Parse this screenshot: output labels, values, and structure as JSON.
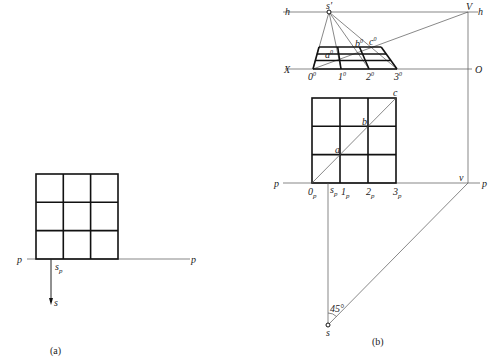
{
  "figure_a": {
    "caption": "(a)",
    "labels": {
      "p_left": "p",
      "p_right": "p",
      "s_p": "s",
      "s_p_sub": "p",
      "s": "s"
    },
    "grid": {
      "rows": 3,
      "cols": 3
    }
  },
  "figure_b": {
    "caption": "(b)",
    "labels": {
      "h_left": "h",
      "h_right": "h",
      "s_prime": "s′",
      "V": "V",
      "X": "X",
      "O": "O",
      "p_left": "p",
      "p_right": "p",
      "v": "v",
      "a": "a",
      "b": "b",
      "c": "c",
      "a0": "a",
      "b0": "b",
      "c0": "c",
      "sup0": "0",
      "pts_picture": [
        "0",
        "1",
        "2",
        "3"
      ],
      "pts_plan": [
        "0",
        "1",
        "2",
        "3"
      ],
      "sub_p": "p",
      "s_p": "s",
      "s": "s",
      "angle": "45°"
    },
    "grid": {
      "rows": 3,
      "cols": 3
    }
  },
  "colors": {
    "line": "#111111",
    "thin_line": "#555555",
    "background": "#ffffff"
  }
}
